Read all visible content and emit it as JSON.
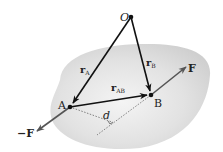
{
  "diagram": {
    "points": {
      "origin": "O",
      "a": "A",
      "b": "B"
    },
    "vectors": {
      "r_a": {
        "base": "r",
        "sub": "A"
      },
      "r_b": {
        "base": "r",
        "sub": "B"
      },
      "r_ab": {
        "base": "r",
        "sub": "AB"
      },
      "force": "F",
      "neg_force": "−F"
    },
    "distance_label": "d",
    "colors": {
      "body_fill": "#d6d6d6",
      "vector": "#111111",
      "force": "#555555",
      "dashed": "#666666"
    }
  }
}
